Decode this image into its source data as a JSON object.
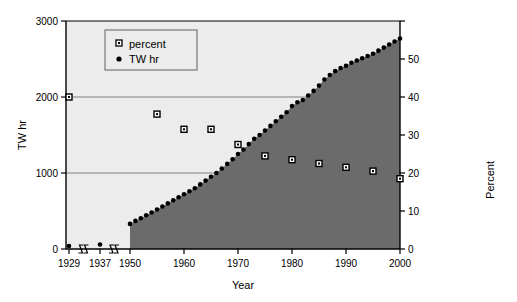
{
  "chart_data": {
    "type": "area",
    "title": "",
    "subtitle": "",
    "xlabel": "Year",
    "ylabel": "TW hr",
    "y2label": "Percent",
    "xlim": [
      1929,
      2000
    ],
    "ylim": [
      0,
      3000
    ],
    "y2lim": [
      0,
      60
    ],
    "grid": "horizontal gridlines at 1000 and 2000 TW hr",
    "legend_position": "top-left inside plot",
    "axis_breaks": [
      "between 1929 and 1937",
      "between 1937 and 1950"
    ],
    "x_tick_labels": [
      "1929",
      "1937",
      "1950",
      "1960",
      "1970",
      "1980",
      "1990",
      "2000"
    ],
    "y_tick_labels": [
      "0",
      "1000",
      "2000",
      "3000"
    ],
    "y2_tick_labels": [
      "0",
      "10",
      "20",
      "30",
      "40",
      "50"
    ],
    "y_ticks": [
      0,
      1000,
      2000,
      3000
    ],
    "y2_ticks": [
      0,
      10,
      20,
      30,
      40,
      50,
      60
    ],
    "series": [
      {
        "name": "percent",
        "marker": "open-square",
        "axis": "right",
        "x": [
          1929,
          1937,
          1955,
          1960,
          1965,
          1970,
          1975,
          1980,
          1985,
          1990,
          1995,
          2000
        ],
        "values": [
          40.0,
          null,
          35.5,
          31.5,
          31.5,
          27.5,
          24.5,
          23.5,
          22.5,
          21.5,
          20.5,
          18.5
        ]
      },
      {
        "name": "TW hr",
        "marker": "filled-circle",
        "axis": "left",
        "x": [
          1929,
          1937,
          1950,
          1951,
          1952,
          1953,
          1954,
          1955,
          1956,
          1957,
          1958,
          1959,
          1960,
          1961,
          1962,
          1963,
          1964,
          1965,
          1966,
          1967,
          1968,
          1969,
          1970,
          1971,
          1972,
          1973,
          1974,
          1975,
          1976,
          1977,
          1978,
          1979,
          1980,
          1981,
          1982,
          1983,
          1984,
          1985,
          1986,
          1987,
          1988,
          1989,
          1990,
          1991,
          1992,
          1993,
          1994,
          1995,
          1996,
          1997,
          1998,
          1999,
          2000
        ],
        "values": [
          40,
          60,
          330,
          370,
          405,
          445,
          480,
          520,
          560,
          600,
          640,
          680,
          720,
          760,
          800,
          850,
          900,
          950,
          1000,
          1060,
          1120,
          1180,
          1250,
          1310,
          1380,
          1450,
          1500,
          1560,
          1620,
          1680,
          1740,
          1800,
          1880,
          1930,
          1960,
          2020,
          2080,
          2150,
          2230,
          2290,
          2340,
          2380,
          2410,
          2450,
          2480,
          2510,
          2540,
          2570,
          2610,
          2650,
          2690,
          2730,
          2770
        ]
      }
    ],
    "colors": {
      "plot_background": "#ececec",
      "area_fill": "#6b6b6b",
      "marker": "#000000",
      "gridline": "#808080",
      "axis": "#000000"
    }
  },
  "legend": {
    "items": [
      {
        "label": "percent",
        "marker": "open-square"
      },
      {
        "label": "TW hr",
        "marker": "filled-circle"
      }
    ]
  },
  "axes": {
    "y_title": "TW hr",
    "y2_title": "Percent",
    "x_title": "Year"
  }
}
